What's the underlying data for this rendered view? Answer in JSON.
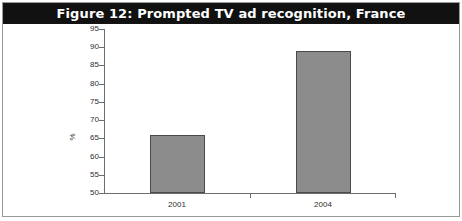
{
  "figure": {
    "title": "Figure 12: Prompted TV ad recognition, France",
    "title_background": "#111111",
    "title_color": "#ffffff",
    "border_color": "#9a9a9a",
    "background": "#ffffff"
  },
  "chart_data": {
    "type": "bar",
    "title": "Figure 12: Prompted TV ad recognition, France",
    "categories": [
      "2001",
      "2004"
    ],
    "values": [
      66,
      89
    ],
    "xlabel": "",
    "ylabel": "%",
    "ylim": [
      50,
      95
    ],
    "yticks": [
      50,
      55,
      60,
      65,
      70,
      75,
      80,
      85,
      90,
      95
    ],
    "ytick_labels": [
      "50",
      "55",
      "60",
      "65",
      "70",
      "75",
      "80",
      "85",
      "90",
      "95"
    ],
    "grid": false,
    "legend": null,
    "bar_fill_color": "#8c8c8c",
    "bar_border_color": "#4a4a4a",
    "axis_color": "#6d6d6d"
  }
}
